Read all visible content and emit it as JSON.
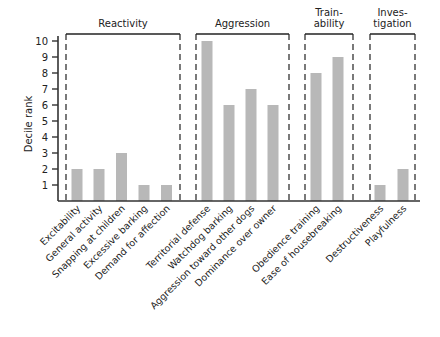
{
  "chart_data": {
    "type": "bar",
    "title": "",
    "xlabel": "",
    "ylabel": "Decile rank",
    "ylim": [
      0,
      10
    ],
    "yticks": [
      1,
      2,
      3,
      4,
      5,
      6,
      7,
      8,
      9,
      10
    ],
    "grid": false,
    "legend": "none",
    "groups": [
      {
        "label_lines": [
          "Reactivity"
        ],
        "categories": [
          "Excitability",
          "General activity",
          "Snapping at children",
          "Excessive barking",
          "Demand for affection"
        ]
      },
      {
        "label_lines": [
          "Aggression"
        ],
        "categories": [
          "Territorial defense",
          "Watchdog barking",
          "Aggression toward other dogs",
          "Dominance over owner"
        ]
      },
      {
        "label_lines": [
          "Train-",
          "ability"
        ],
        "categories": [
          "Obedience training",
          "Ease of housebreaking"
        ]
      },
      {
        "label_lines": [
          "Inves-",
          "tigation"
        ],
        "categories": [
          "Destructiveness",
          "Playfulness"
        ]
      }
    ],
    "categories": [
      "Excitability",
      "General activity",
      "Snapping at children",
      "Excessive barking",
      "Demand for affection",
      "Territorial defense",
      "Watchdog barking",
      "Aggression toward other dogs",
      "Dominance over owner",
      "Obedience training",
      "Ease of housebreaking",
      "Destructiveness",
      "Playfulness"
    ],
    "values": [
      2,
      2,
      3,
      1,
      1,
      10,
      6,
      7,
      6,
      8,
      9,
      1,
      2
    ],
    "colors": {
      "bar": "#b8b8b8",
      "axis": "#333333"
    }
  }
}
